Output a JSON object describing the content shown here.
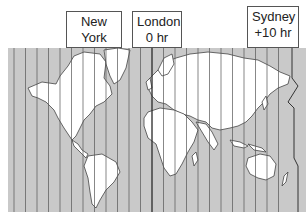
{
  "labels": [
    {
      "city": "New York",
      "offset": "− 5 hr",
      "x": 66,
      "y": 11,
      "w": 56,
      "h": 37
    },
    {
      "city": "London",
      "offset": "0 hr",
      "x": 132,
      "y": 11,
      "w": 50,
      "h": 37
    },
    {
      "city": "Sydney",
      "offset": "+10 hr",
      "x": 247,
      "y": 6,
      "w": 52,
      "h": 42
    }
  ],
  "map": {
    "ocean_color": "#c9c9c9",
    "land_color": "#ffffff",
    "line_color": "#444444",
    "timezone_line_spacing": 11.5
  }
}
